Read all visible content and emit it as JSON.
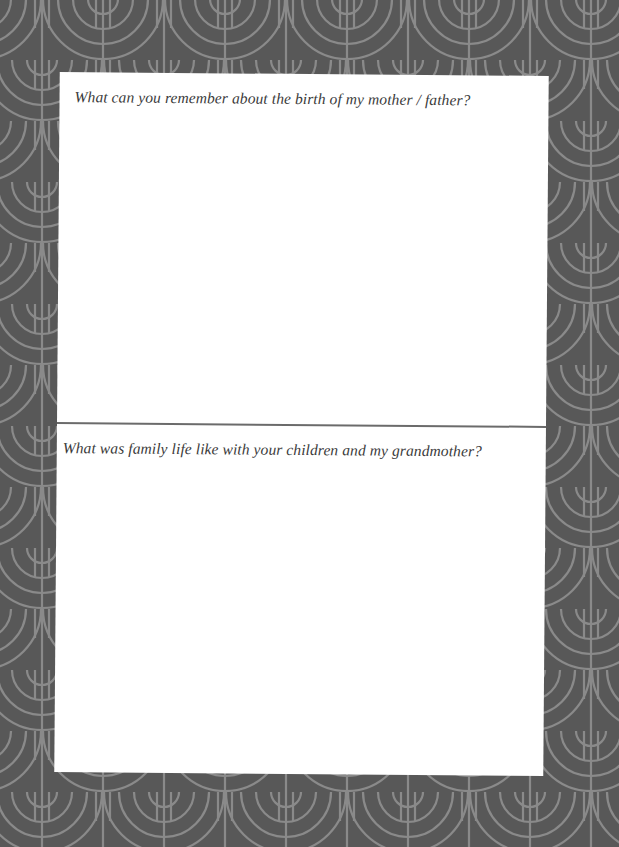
{
  "page": {
    "background_color": "#585858",
    "pattern_line_color": "#8a8a8a",
    "pattern": "art-deco-fan-pattern",
    "card_color": "#ffffff",
    "divider_color": "#6b6b6b",
    "text_color": "#3a3a3a"
  },
  "prompts": [
    {
      "question": "What can you remember about the birth of my mother / father?",
      "answer": ""
    },
    {
      "question": "What was family life like with your children and my grandmother?",
      "answer": ""
    }
  ]
}
